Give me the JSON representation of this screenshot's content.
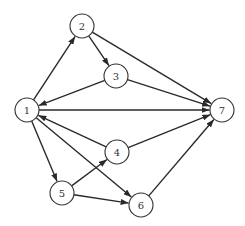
{
  "diagram": {
    "type": "directed-graph",
    "node_radius": 12,
    "colors": {
      "edge": "#2a2a2a",
      "node_stroke": "#333333",
      "node_fill": "#ffffff",
      "label": "#333333",
      "background": "#ffffff"
    },
    "nodes": [
      {
        "id": "1",
        "label": "1",
        "x": 27,
        "y": 110
      },
      {
        "id": "2",
        "label": "2",
        "x": 82,
        "y": 26
      },
      {
        "id": "3",
        "label": "3",
        "x": 116,
        "y": 76
      },
      {
        "id": "4",
        "label": "4",
        "x": 117,
        "y": 152
      },
      {
        "id": "5",
        "label": "5",
        "x": 62,
        "y": 193
      },
      {
        "id": "6",
        "label": "6",
        "x": 141,
        "y": 205
      },
      {
        "id": "7",
        "label": "7",
        "x": 222,
        "y": 110
      }
    ],
    "edges": [
      {
        "from": "1",
        "to": "2"
      },
      {
        "from": "2",
        "to": "3"
      },
      {
        "from": "2",
        "to": "7"
      },
      {
        "from": "3",
        "to": "1"
      },
      {
        "from": "3",
        "to": "7"
      },
      {
        "from": "1",
        "to": "7"
      },
      {
        "from": "4",
        "to": "1"
      },
      {
        "from": "4",
        "to": "7"
      },
      {
        "from": "1",
        "to": "5"
      },
      {
        "from": "1",
        "to": "6"
      },
      {
        "from": "5",
        "to": "4"
      },
      {
        "from": "5",
        "to": "6"
      },
      {
        "from": "6",
        "to": "7"
      }
    ]
  }
}
